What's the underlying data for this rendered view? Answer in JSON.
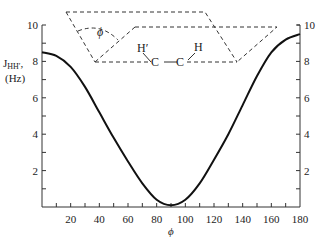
{
  "chart_data": {
    "type": "line",
    "title": "",
    "xlabel": "ϕ",
    "ylabel": "J_HH′ (Hz)",
    "ylabel_main": "J",
    "ylabel_sub": "HH′",
    "ylabel_units": "(Hz)",
    "xlim": [
      0,
      180
    ],
    "ylim": [
      0,
      10
    ],
    "grid": false,
    "legend": null,
    "x_ticks": [
      20,
      40,
      60,
      80,
      100,
      120,
      140,
      160,
      180
    ],
    "x_tick_labels": [
      "20",
      "40",
      "60",
      "80",
      "100",
      "120",
      "140",
      "160",
      "180"
    ],
    "y_ticks": [
      2,
      4,
      6,
      8,
      10
    ],
    "y_tick_labels": [
      "2",
      "4",
      "6",
      "8",
      "10"
    ],
    "right_y_tick_labels": [
      "2",
      "4",
      "6",
      "8",
      "10"
    ],
    "series": [
      {
        "name": "Karplus curve",
        "x": [
          0,
          10,
          20,
          30,
          40,
          50,
          60,
          70,
          80,
          90,
          100,
          110,
          120,
          130,
          140,
          150,
          160,
          170,
          180
        ],
        "values": [
          8.5,
          8.3,
          7.7,
          6.6,
          5.2,
          3.8,
          2.5,
          1.3,
          0.4,
          0.1,
          0.4,
          1.3,
          2.6,
          4.0,
          5.6,
          7.2,
          8.5,
          9.2,
          9.5
        ]
      }
    ],
    "annotations": {
      "inset_diagram": "Newman-style H–C–C–H dihedral angle diagram",
      "angle_label": "ϕ",
      "atom_labels": [
        "H′",
        "C",
        "C",
        "H"
      ]
    }
  }
}
